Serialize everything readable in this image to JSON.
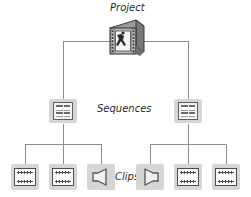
{
  "diagram": {
    "type": "tree",
    "colors": {
      "line": "#8d8d8d",
      "tile": "#d6d6d6",
      "icon_outline": "#4f4f4f",
      "text": "#2b2b2b"
    },
    "labels": {
      "project": "Project",
      "sequences": "Sequences",
      "clips": "Clips"
    },
    "levels": [
      {
        "name": "project",
        "label": "Project",
        "nodes": [
          {
            "id": "project-1",
            "icon": "project-film-icon",
            "type": "project"
          }
        ]
      },
      {
        "name": "sequences",
        "label": "Sequences",
        "nodes": [
          {
            "id": "sequence-1",
            "icon": "sequence-icon",
            "type": "sequence"
          },
          {
            "id": "sequence-2",
            "icon": "sequence-icon",
            "type": "sequence"
          }
        ]
      },
      {
        "name": "clips",
        "label": "Clips",
        "nodes": [
          {
            "id": "clip-1",
            "icon": "video-clip-icon",
            "type": "video",
            "parent": "sequence-1"
          },
          {
            "id": "clip-2",
            "icon": "video-clip-icon",
            "type": "video",
            "parent": "sequence-1"
          },
          {
            "id": "clip-3",
            "icon": "audio-clip-icon",
            "type": "audio",
            "parent": "sequence-1"
          },
          {
            "id": "clip-4",
            "icon": "audio-clip-icon",
            "type": "audio",
            "parent": "sequence-2"
          },
          {
            "id": "clip-5",
            "icon": "video-clip-icon",
            "type": "video",
            "parent": "sequence-2"
          },
          {
            "id": "clip-6",
            "icon": "video-clip-icon",
            "type": "video",
            "parent": "sequence-2"
          }
        ]
      }
    ]
  }
}
